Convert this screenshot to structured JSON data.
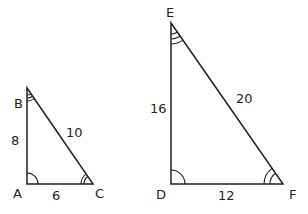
{
  "diagram": {
    "type": "similar-triangles",
    "triangles": [
      {
        "name": "ABC",
        "vertices": {
          "A": "A",
          "B": "B",
          "C": "C"
        },
        "sides": {
          "AB": "8",
          "BC": "10",
          "AC": "6"
        },
        "angle_marks": {
          "A": "single-arc",
          "B": "triple-arc",
          "C": "double-arc"
        }
      },
      {
        "name": "DEF",
        "vertices": {
          "D": "D",
          "E": "E",
          "F": "F"
        },
        "sides": {
          "DE": "16",
          "EF": "20",
          "DF": "12"
        },
        "angle_marks": {
          "D": "single-arc",
          "E": "triple-arc",
          "F": "double-arc"
        }
      }
    ]
  },
  "labels": {
    "A": "A",
    "B": "B",
    "C": "C",
    "D": "D",
    "E": "E",
    "F": "F",
    "AB": "8",
    "BC": "10",
    "AC": "6",
    "DE": "16",
    "EF": "20",
    "DF": "12"
  },
  "colors": {
    "stroke": "#231f20",
    "background": "#ffffff"
  }
}
